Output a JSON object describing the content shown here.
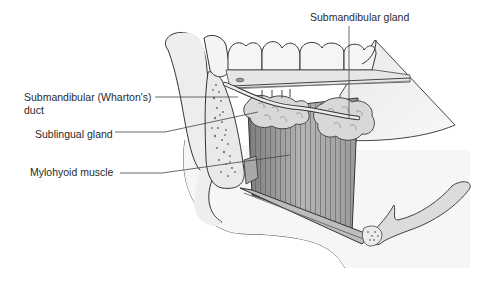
{
  "figure": {
    "labels": {
      "submandibular_gland": "Submandibular gland",
      "submandibular_duct_line1": "Submandibular (Wharton's)",
      "submandibular_duct_line2": "duct",
      "sublingual_gland": "Sublingual gland",
      "mylohyoid_muscle": "Mylohyoid muscle"
    },
    "colors": {
      "outline": "#3a3a3a",
      "bone_fill": "#ececec",
      "tooth_fill": "#f4f4f4",
      "gland_fill": "#d6d6d6",
      "muscle_fill": "#b8b8b8",
      "muscle_dark": "#8e8e8e",
      "soft_tissue": "#f2f2f2",
      "leader_line": "#444444"
    }
  }
}
